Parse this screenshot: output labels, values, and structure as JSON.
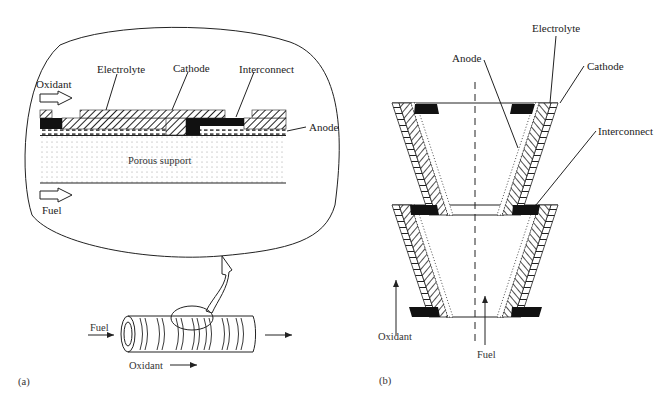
{
  "figure": {
    "panel_a": {
      "tag": "(a)",
      "inset": {
        "labels": {
          "oxidant": "Oxidant",
          "fuel": "Fuel",
          "electrolyte": "Electrolyte",
          "cathode": "Cathode",
          "interconnect": "Interconnect",
          "anode": "Anode",
          "porous_support": "Porous support"
        }
      },
      "tube": {
        "labels": {
          "fuel": "Fuel",
          "oxidant": "Oxidant"
        }
      }
    },
    "panel_b": {
      "tag": "(b)",
      "labels": {
        "anode": "Anode",
        "electrolyte": "Electrolyte",
        "cathode": "Cathode",
        "interconnect": "Interconnect",
        "oxidant": "Oxidant",
        "fuel": "Fuel"
      }
    },
    "colors": {
      "line": "#222222",
      "fill_dark": "#111111",
      "dots": "#999999"
    }
  }
}
